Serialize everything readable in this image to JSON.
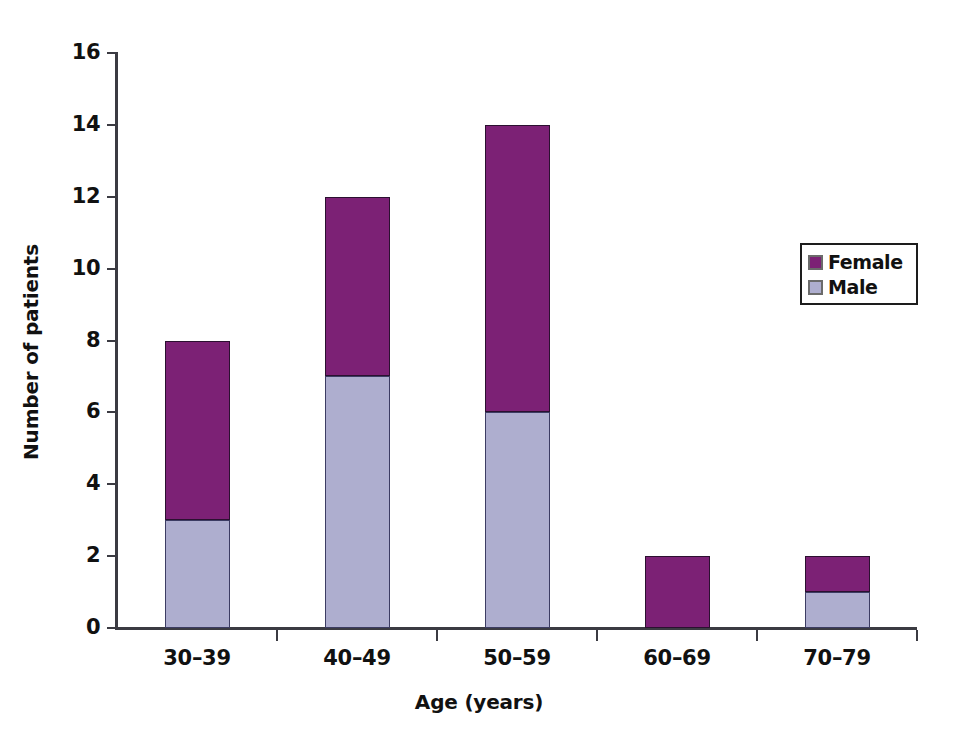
{
  "chart_data": {
    "type": "bar",
    "subtype": "stacked-vertical",
    "title": "",
    "xlabel": "Age (years)",
    "ylabel": "Number of patients",
    "categories": [
      "30–39",
      "40–49",
      "50–59",
      "60–69",
      "70–79"
    ],
    "series": [
      {
        "name": "Female",
        "color": "#7c2175",
        "values": [
          5,
          5,
          8,
          2,
          1
        ]
      },
      {
        "name": "Male",
        "color": "#aeaecf",
        "values": [
          3,
          7,
          6,
          0,
          1
        ]
      }
    ],
    "stack_order_bottom_to_top": [
      "Male",
      "Female"
    ],
    "totals": [
      8,
      12,
      14,
      2,
      2
    ],
    "ylim": [
      0,
      16
    ],
    "ytick_labels": [
      "0",
      "2",
      "4",
      "6",
      "8",
      "10",
      "12",
      "14",
      "16"
    ],
    "ytick_values": [
      0,
      2,
      4,
      6,
      8,
      10,
      12,
      14,
      16
    ],
    "ytick_interval": 2,
    "grid": false,
    "legend": {
      "position": "top-right",
      "bordered": true,
      "entries": [
        {
          "label": "Female",
          "color": "#7c2175"
        },
        {
          "label": "Male",
          "color": "#aeaecf"
        }
      ]
    },
    "axis_color": "#3b3b42",
    "background": "#ffffff"
  }
}
